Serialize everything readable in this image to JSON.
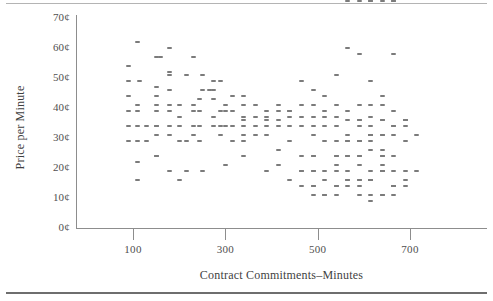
{
  "figure": {
    "rules": [
      "top-rule",
      "bottom-rule"
    ]
  },
  "chart_data": {
    "type": "scatter",
    "title": "",
    "xlabel": "Contract Commitments–Minutes",
    "ylabel": "Price per Minute",
    "xlim": [
      0,
      760
    ],
    "ylim": [
      0,
      70
    ],
    "grid": false,
    "legend": null,
    "xticks": [
      100,
      300,
      500,
      700
    ],
    "xtick_labels": [
      "100",
      "300",
      "500",
      "700"
    ],
    "yticks": [
      0,
      10,
      20,
      30,
      40,
      50,
      60,
      70
    ],
    "ytick_labels": [
      "0¢",
      "10¢",
      "20¢",
      "30¢",
      "40¢",
      "50¢",
      "60¢",
      "70¢"
    ],
    "marker": "horizontal-dash",
    "marker_color": "#7b7b7b",
    "point_count": 232,
    "x": [
      110,
      90,
      150,
      160,
      178,
      178,
      230,
      90,
      115,
      150,
      178,
      215,
      250,
      275,
      90,
      150,
      178,
      250,
      275,
      110,
      150,
      178,
      200,
      230,
      245,
      275,
      300,
      340,
      90,
      110,
      150,
      178,
      200,
      230,
      245,
      275,
      300,
      340,
      90,
      110,
      130,
      150,
      178,
      200,
      230,
      245,
      275,
      300,
      90,
      110,
      130,
      150,
      178,
      200,
      230,
      245,
      110,
      150,
      178,
      215,
      250,
      300,
      110,
      200,
      150,
      215,
      150,
      265,
      290,
      315,
      340,
      365,
      390,
      415,
      440,
      465,
      490,
      515,
      540,
      565,
      590,
      615,
      640,
      665,
      690,
      290,
      315,
      340,
      365,
      390,
      415,
      440,
      465,
      490,
      515,
      540,
      565,
      590,
      615,
      640,
      665,
      690,
      290,
      315,
      340,
      365,
      390,
      415,
      440,
      465,
      490,
      515,
      540,
      565,
      590,
      615,
      640,
      665,
      690,
      715,
      290,
      315,
      340,
      365,
      390,
      415,
      440,
      465,
      490,
      515,
      540,
      565,
      590,
      615,
      640,
      665,
      690,
      340,
      390,
      440,
      490,
      515,
      540,
      565,
      590,
      615,
      640,
      340,
      415,
      465,
      490,
      540,
      590,
      640,
      390,
      415,
      465,
      490,
      515,
      540,
      565,
      615,
      640,
      690,
      440,
      465,
      490,
      515,
      565,
      590,
      615,
      665,
      690,
      465,
      490,
      540,
      565,
      590,
      615,
      640,
      490,
      515,
      590,
      615,
      640,
      665,
      490,
      565,
      590,
      615,
      640,
      665,
      690,
      715,
      540,
      565,
      590,
      615,
      640,
      665,
      490,
      540,
      590,
      640,
      665,
      515,
      565,
      615,
      665,
      690,
      540,
      590,
      640,
      565,
      615,
      665,
      540,
      590,
      615,
      640,
      590,
      615,
      640,
      665,
      565,
      615,
      640,
      590,
      615,
      665
    ],
    "y": [
      62,
      54,
      57,
      57,
      60,
      52,
      57,
      49,
      49,
      47,
      51,
      51,
      51,
      49,
      44,
      44,
      46,
      46,
      46,
      41,
      41,
      41,
      41,
      41,
      43,
      43,
      41,
      41,
      39,
      39,
      39,
      39,
      37,
      39,
      39,
      37,
      39,
      36,
      34,
      34,
      34,
      34,
      34,
      34,
      34,
      34,
      34,
      34,
      29,
      29,
      29,
      31,
      31,
      29,
      31,
      29,
      22,
      24,
      19,
      19,
      19,
      21,
      16,
      16,
      24,
      29,
      34,
      46,
      49,
      44,
      44,
      41,
      39,
      41,
      39,
      49,
      46,
      44,
      51,
      60,
      58,
      49,
      44,
      58,
      36,
      39,
      39,
      37,
      37,
      37,
      39,
      39,
      41,
      41,
      39,
      41,
      39,
      41,
      41,
      41,
      39,
      36,
      34,
      34,
      34,
      34,
      36,
      36,
      37,
      37,
      37,
      37,
      37,
      36,
      36,
      37,
      36,
      34,
      36,
      31,
      31,
      29,
      31,
      31,
      34,
      34,
      34,
      34,
      34,
      34,
      34,
      31,
      34,
      31,
      31,
      34,
      29,
      29,
      31,
      29,
      31,
      29,
      29,
      29,
      29,
      29,
      24,
      24,
      26,
      24,
      24,
      24,
      24,
      21,
      19,
      21,
      19,
      19,
      19,
      19,
      19,
      19,
      19,
      16,
      16,
      19,
      19,
      16,
      16,
      16,
      16,
      14,
      14,
      14,
      14,
      14,
      14,
      14,
      11,
      11,
      11,
      11,
      11,
      16,
      26,
      24,
      24,
      24,
      24,
      31,
      36,
      19,
      19,
      19,
      21,
      24,
      29,
      9,
      19,
      14,
      14,
      14,
      16,
      11,
      11,
      11,
      29,
      31,
      31,
      34,
      24,
      21,
      19,
      16,
      16,
      14,
      11,
      29,
      26,
      24,
      36,
      34,
      31
    ]
  }
}
